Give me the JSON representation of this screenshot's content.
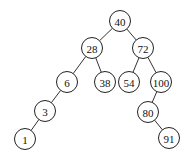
{
  "diagram": {
    "type": "binary-search-tree",
    "radius": 10.5,
    "nodes": [
      {
        "id": "n40",
        "label": "40",
        "x": 120,
        "y": 21
      },
      {
        "id": "n28",
        "label": "28",
        "x": 92,
        "y": 48
      },
      {
        "id": "n72",
        "label": "72",
        "x": 143,
        "y": 48
      },
      {
        "id": "n6",
        "label": "6",
        "x": 67,
        "y": 82
      },
      {
        "id": "n38",
        "label": "38",
        "x": 105,
        "y": 82
      },
      {
        "id": "n54",
        "label": "54",
        "x": 129,
        "y": 82
      },
      {
        "id": "n100",
        "label": "100",
        "x": 161,
        "y": 82
      },
      {
        "id": "n3",
        "label": "3",
        "x": 45,
        "y": 111
      },
      {
        "id": "n80",
        "label": "80",
        "x": 148,
        "y": 112
      },
      {
        "id": "n1",
        "label": "1",
        "x": 25,
        "y": 139
      },
      {
        "id": "n91",
        "label": "91",
        "x": 169,
        "y": 138
      }
    ],
    "edges": [
      {
        "from": "n40",
        "to": "n28"
      },
      {
        "from": "n40",
        "to": "n72"
      },
      {
        "from": "n28",
        "to": "n6"
      },
      {
        "from": "n28",
        "to": "n38"
      },
      {
        "from": "n72",
        "to": "n54"
      },
      {
        "from": "n72",
        "to": "n100"
      },
      {
        "from": "n6",
        "to": "n3"
      },
      {
        "from": "n3",
        "to": "n1"
      },
      {
        "from": "n100",
        "to": "n80"
      },
      {
        "from": "n80",
        "to": "n91"
      }
    ]
  }
}
